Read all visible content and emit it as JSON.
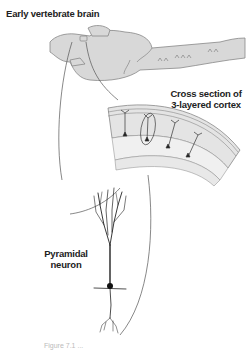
{
  "labels": {
    "early_brain": "Early vertebrate brain",
    "cortex_line1": "Cross section of",
    "cortex_line2": "3-layered cortex",
    "neuron_line1": "Pyramidal",
    "neuron_line2": "neuron"
  },
  "caption": "Figure 7.1 ...",
  "colors": {
    "tissue_fill": "#d8d8d8",
    "tissue_stroke": "#888888",
    "cortex_band": "#e4e4e4",
    "line": "#444444",
    "text": "#222222"
  }
}
